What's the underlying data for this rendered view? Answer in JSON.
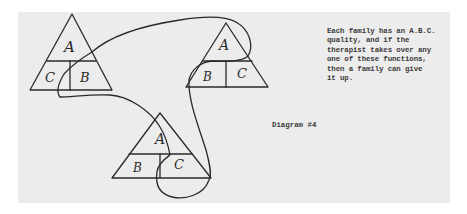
{
  "diagram": {
    "title": "Diagram #4",
    "note": "Each family has an A.B.C.\nquality, and if the\ntherapist takes over any\none of these functions,\nthen a family can give\nit up.",
    "triangles": [
      {
        "id": "left",
        "top": "A",
        "bottom_left": "C",
        "bottom_right": "B"
      },
      {
        "id": "right",
        "top": "A",
        "bottom_left": "B",
        "bottom_right": "C"
      },
      {
        "id": "bottom",
        "top": "A",
        "bottom_left": "B",
        "bottom_right": "C"
      }
    ],
    "colors": {
      "paper": "#ececec",
      "ink": "#2a2a2a",
      "background": "#ffffff"
    }
  }
}
